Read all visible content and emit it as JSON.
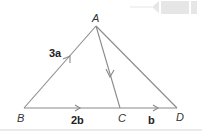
{
  "diagram": {
    "type": "vector-triangle",
    "points": {
      "A": {
        "label": "A",
        "x": 96,
        "y": 26
      },
      "B": {
        "label": "B",
        "x": 24,
        "y": 108
      },
      "C": {
        "label": "C",
        "x": 120,
        "y": 108
      },
      "D": {
        "label": "D",
        "x": 177,
        "y": 108
      }
    },
    "vectors": [
      {
        "from": "B",
        "to": "A",
        "label": "3a"
      },
      {
        "from": "B",
        "to": "C",
        "label": "2b"
      },
      {
        "from": "C",
        "to": "D",
        "label": "b"
      },
      {
        "from": "A",
        "to": "C",
        "label": ""
      }
    ],
    "segments": [
      {
        "from": "A",
        "to": "D"
      }
    ],
    "line_color": "#8a8a8a",
    "decoration": "top-right-tab-arrow"
  }
}
